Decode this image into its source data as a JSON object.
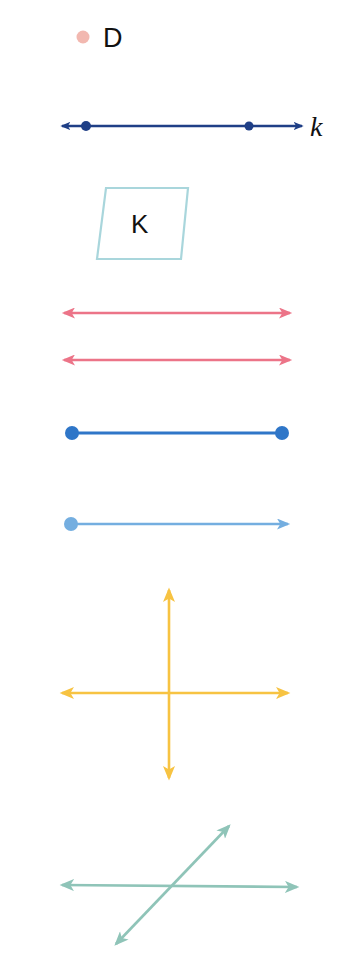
{
  "figures": {
    "point": {
      "label": "D",
      "color": "#f2b8b0"
    },
    "line_k": {
      "label": "k",
      "color": "#1f3f86"
    },
    "plane": {
      "label": "K",
      "color": "#a9d6dc"
    },
    "parallel_lines": {
      "color": "#ec7488"
    },
    "segment": {
      "color": "#2f76c8"
    },
    "ray": {
      "color": "#74aee0"
    },
    "perpendicular_lines": {
      "color": "#f7c342"
    },
    "intersecting_lines": {
      "color": "#8fc4b8"
    }
  }
}
